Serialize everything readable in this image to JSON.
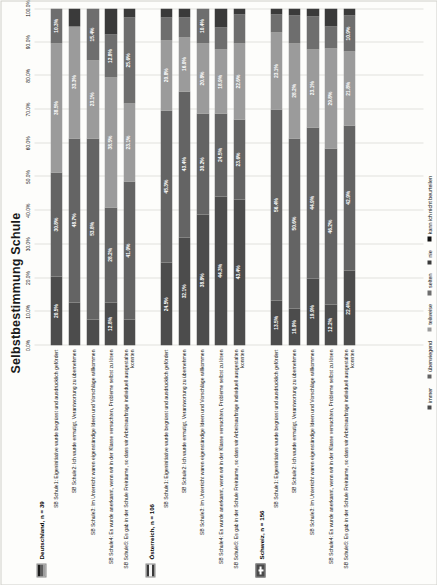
{
  "chart_data": {
    "type": "bar",
    "orientation": "horizontal-stacked",
    "title": "Selbstbestimmung Schule",
    "xlabel": "",
    "ylabel": "",
    "xlim": [
      0,
      100
    ],
    "grid": true,
    "legend_position": "bottom",
    "tick_labels": [
      "0.0%",
      "10.0%",
      "20.0%",
      "30.0%",
      "40.0%",
      "50.0%",
      "60.0%",
      "70.0%",
      "80.0%",
      "90.0%",
      "100.0%"
    ],
    "tick_values": [
      0,
      10,
      20,
      30,
      40,
      50,
      60,
      70,
      80,
      90,
      100
    ],
    "series": [
      {
        "name": "immer",
        "color": "#4c4c4c"
      },
      {
        "name": "überwiegend",
        "color": "#646464"
      },
      {
        "name": "teilweise",
        "color": "#9b9b9b"
      },
      {
        "name": "selten",
        "color": "#6e6e6e"
      },
      {
        "name": "nie",
        "color": "#3a3a3a"
      },
      {
        "name": "kann ich nicht beurteilen",
        "color": "#111111"
      }
    ],
    "groups": [
      {
        "name": "Deutschland",
        "n_label": "Deutschland,  n = 39",
        "flag": "flag-de",
        "categories": [
          "SB Schule1: Eigeninitiative wurde begrüsst und ausdrücklich gefördert",
          "SB Schule2: Ich wurde ermutigt, Verantwortung zu übernehmen",
          "SB Schule3: Im Unterricht waren eigenständige Ideen und Vorschläge willkommen",
          "SB Schule4: Es wurde anerkannt, wenn wir in der Klasse versuchten, Probleme selbst zu lösen",
          "SB Schule5: Es gab in der Schule Freiräume, so dass wir Arbeitsaufträge individuell ausgestalten konnten"
        ],
        "values": [
          [
            20.5,
            30.8,
            38.5,
            10.3,
            0.0,
            0.0
          ],
          [
            12.8,
            48.7,
            33.3,
            0.0,
            5.2,
            0.0
          ],
          [
            7.7,
            53.8,
            23.1,
            15.4,
            0.0,
            0.0
          ],
          [
            12.8,
            28.2,
            38.5,
            12.8,
            7.7,
            0.0
          ],
          [
            7.7,
            41.0,
            23.1,
            25.6,
            2.6,
            0.0
          ]
        ],
        "labels": [
          [
            "20.5%",
            "30.8%",
            "38.5%",
            "10.3%",
            "",
            ""
          ],
          [
            "",
            "48.7%",
            "33.3%",
            "",
            "",
            ""
          ],
          [
            "",
            "53.8%",
            "23.1%",
            "15.4%",
            "",
            ""
          ],
          [
            "12.8%",
            "28.2%",
            "38.5%",
            "12.8%",
            "",
            ""
          ],
          [
            "",
            "41.0%",
            "23.1%",
            "25.6%",
            "",
            ""
          ]
        ]
      },
      {
        "name": "Österreich",
        "n_label": "Österreich,  n = 106",
        "flag": "flag-at",
        "categories": [
          "SB Schule1: Eigeninitiative wurde begrüsst und ausdrücklich gefördert",
          "SB Schule2: Ich wurde ermutigt, Verantwortung zu übernehmen",
          "SB Schule3: Im Unterricht waren eigenständige Ideen und Vorschläge willkommen",
          "SB Schule4: Es wurde anerkannt, wenn wir in der Klasse versuchten, Probleme selbst zu lösen",
          "SB Schule5: Es gab in der Schule Freiräume, so dass wir Arbeitsaufträge individuell ausgestalten konnten"
        ],
        "values": [
          [
            24.5,
            45.3,
            20.8,
            6.6,
            2.8,
            0.0
          ],
          [
            32.1,
            43.4,
            16.0,
            5.7,
            2.8,
            0.0
          ],
          [
            38.8,
            30.2,
            20.8,
            10.4,
            0.0,
            0.0
          ],
          [
            44.3,
            24.5,
            18.9,
            6.6,
            5.7,
            0.0
          ],
          [
            43.4,
            23.6,
            22.6,
            8.5,
            1.9,
            0.0
          ]
        ],
        "labels": [
          [
            "24.5%",
            "45.3%",
            "20.8%",
            "",
            "",
            ""
          ],
          [
            "32.1%",
            "43.4%",
            "16.0%",
            "",
            "",
            ""
          ],
          [
            "38.8%",
            "30.2%",
            "20.8%",
            "10.4%",
            "",
            ""
          ],
          [
            "44.3%",
            "24.5%",
            "18.9%",
            "",
            "",
            ""
          ],
          [
            "43.4%",
            "23.6%",
            "22.6%",
            "",
            "",
            ""
          ]
        ]
      },
      {
        "name": "Schweiz",
        "n_label": "Schweiz,  n = 156",
        "flag": "flag-ch",
        "categories": [
          "SB Schule1: Eigeninitiative wurde begrüsst und ausdrücklich gefördert",
          "SB Schule2: Ich wurde ermutigt, Verantwortung zu übernehmen",
          "SB Schule3: Im Unterricht waren eigenständige Ideen und Vorschläge willkommen",
          "SB Schule4: Es wurde anerkannt, wenn wir in der Klasse versuchten, Probleme selbst zu lösen",
          "SB Schule5: Es gab in der Schule Freiräume, so dass wir Arbeitsaufträge individuell ausgestalten konnten"
        ],
        "values": [
          [
            13.5,
            56.4,
            23.1,
            5.1,
            1.9,
            0.0
          ],
          [
            10.9,
            50.6,
            28.2,
            8.3,
            2.0,
            0.0
          ],
          [
            19.9,
            44.9,
            23.1,
            9.6,
            2.5,
            0.0
          ],
          [
            12.2,
            46.2,
            29.8,
            6.4,
            5.4,
            0.0
          ],
          [
            22.4,
            42.9,
            21.8,
            10.9,
            2.0,
            0.0
          ]
        ],
        "labels": [
          [
            "13.5%",
            "56.4%",
            "23.1%",
            "",
            "",
            ""
          ],
          [
            "10.9%",
            "50.6%",
            "28.2%",
            "",
            "",
            ""
          ],
          [
            "19.9%",
            "44.9%",
            "23.1%",
            "",
            "",
            ""
          ],
          [
            "12.2%",
            "46.2%",
            "29.8%",
            "",
            "",
            ""
          ],
          [
            "22.4%",
            "42.9%",
            "21.8%",
            "10.9%",
            "",
            ""
          ]
        ]
      }
    ]
  }
}
